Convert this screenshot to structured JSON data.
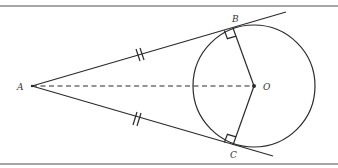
{
  "diagram": {
    "type": "geometry",
    "labels": {
      "A": "A",
      "B": "B",
      "C": "C",
      "O": "O"
    },
    "points": {
      "A": [
        32,
        86
      ],
      "O": [
        254,
        86
      ],
      "B": [
        233,
        28
      ],
      "C": [
        233,
        145
      ]
    },
    "circle": {
      "center": "O",
      "radius": 61
    },
    "segments": [
      {
        "from": "A",
        "to": "B",
        "style": "solid",
        "extends_beyond": true,
        "equal_mark": 2
      },
      {
        "from": "A",
        "to": "C",
        "style": "solid",
        "extends_beyond": true,
        "equal_mark": 2
      },
      {
        "from": "A",
        "to": "O",
        "style": "dashed"
      },
      {
        "from": "O",
        "to": "B",
        "style": "solid"
      },
      {
        "from": "O",
        "to": "C",
        "style": "solid"
      }
    ],
    "right_angles": [
      "B",
      "C"
    ],
    "colors": {
      "line": "#2a2a2a",
      "frame": "#888888",
      "background": "#ffffff"
    }
  }
}
